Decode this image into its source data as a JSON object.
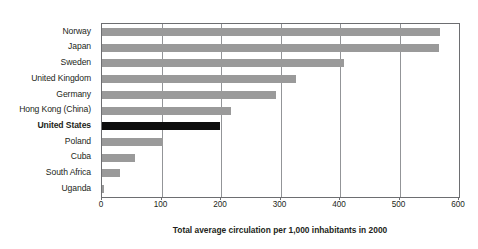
{
  "chart_data": {
    "type": "bar",
    "orientation": "horizontal",
    "title": "",
    "xlabel": "Total average circulation per 1,000 inhabitants in 2000",
    "ylabel": "",
    "xlim": [
      0,
      600
    ],
    "xticks": [
      0,
      100,
      200,
      300,
      400,
      500,
      600
    ],
    "xtick_labels": [
      "0",
      "100",
      "200",
      "300",
      "400",
      "500",
      "600"
    ],
    "grid": "vertical",
    "legend": "none",
    "categories": [
      "Norway",
      "Japan",
      "Sweden",
      "United Kingdom",
      "Germany",
      "Hong Kong (China)",
      "United States",
      "Poland",
      "Cuba",
      "South Africa",
      "Uganda"
    ],
    "values": [
      568,
      566,
      406,
      326,
      293,
      217,
      198,
      102,
      56,
      30,
      3
    ],
    "highlight_category": "United States",
    "colors": {
      "bar": "#9a9a9a",
      "highlight_bar": "#0d0d0d",
      "gridline": "#939598",
      "axis": "#6d6e71",
      "text": "#231f20",
      "background": "#ffffff"
    }
  }
}
